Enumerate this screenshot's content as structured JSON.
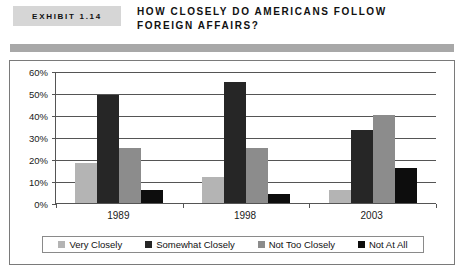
{
  "exhibit": {
    "tag": "EXHIBIT 1.14",
    "title": "HOW CLOSELY DO AMERICANS FOLLOW FOREIGN AFFAIRS?"
  },
  "chart_data": {
    "type": "bar",
    "title": "HOW CLOSELY DO AMERICANS FOLLOW FOREIGN AFFAIRS?",
    "xlabel": "",
    "ylabel": "",
    "categories": [
      "1989",
      "1998",
      "2003"
    ],
    "ylim": [
      0,
      60
    ],
    "ytick_labels": [
      "0%",
      "10%",
      "20%",
      "30%",
      "40%",
      "50%",
      "60%"
    ],
    "ytick_values": [
      0,
      10,
      20,
      30,
      40,
      50,
      60
    ],
    "grid": true,
    "legend_position": "bottom",
    "series": [
      {
        "name": "Very Closely",
        "color": "#b4b4b4",
        "values": [
          18,
          12,
          6
        ]
      },
      {
        "name": "Somewhat Closely",
        "color": "#262626",
        "values": [
          49,
          55,
          33
        ]
      },
      {
        "name": "Not Too Closely",
        "color": "#8c8c8c",
        "values": [
          25,
          25,
          40
        ]
      },
      {
        "name": "Not At All",
        "color": "#0d0d0d",
        "values": [
          6,
          4,
          16
        ]
      }
    ]
  },
  "colors": {
    "exhibit_tag_bg": "#d6d6d6",
    "header_rule": "#a8a8a8",
    "axis": "#555555",
    "frame_border": "#7a7a7a"
  }
}
